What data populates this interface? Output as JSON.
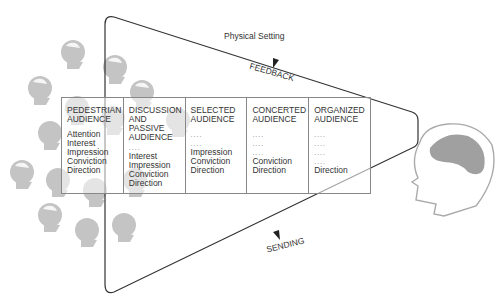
{
  "diagram": {
    "setting_label": "Physical Setting",
    "feedback_label": "FEEDBACK",
    "sending_label": "SENDING",
    "colors": {
      "heads": "#c4c4c4",
      "brain": "#a0a0a0",
      "lines": "#333333"
    },
    "columns": [
      {
        "title_lines": [
          "PEDESTRIAN",
          "AUDIENCE"
        ],
        "items": [
          "Attention",
          "Interest",
          "Impression",
          "Conviction",
          "Direction"
        ]
      },
      {
        "title_lines": [
          "DISCUSSION",
          "AND PASSIVE",
          "AUDIENCE"
        ],
        "items": [
          "....",
          "Interest",
          "Impression",
          "Conviction",
          "Direction"
        ]
      },
      {
        "title_lines": [
          "SELECTED",
          "AUDIENCE"
        ],
        "items": [
          "....",
          "....",
          "Impression",
          "Conviction",
          "Direction"
        ]
      },
      {
        "title_lines": [
          "CONCERTED",
          "AUDIENCE"
        ],
        "items": [
          "....",
          "....",
          "....",
          "Conviction",
          "Direction"
        ]
      },
      {
        "title_lines": [
          "ORGANIZED",
          "AUDIENCE"
        ],
        "items": [
          "....",
          "....",
          "....",
          "....",
          "Direction"
        ]
      }
    ]
  }
}
